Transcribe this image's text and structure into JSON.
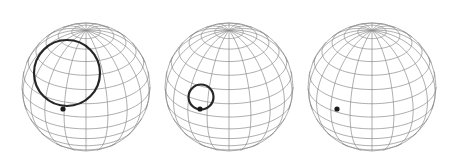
{
  "diagram": {
    "type": "spheres-with-contracting-loop",
    "colors": {
      "grid": "#8a8a8a",
      "outline": "#9a9a9a",
      "loop": "#262626",
      "point": "#1a1a1a",
      "background": "#ffffff"
    },
    "grid": {
      "latitudes": 14,
      "longitudes": 18,
      "tilt_deg": 28
    },
    "spheres": [
      {
        "id": "sphere-1",
        "cx": 86,
        "cy": 87,
        "r": 64,
        "loop": {
          "cx": 67,
          "cy": 73,
          "r": 33
        },
        "point": {
          "x": 63,
          "y": 109,
          "r": 2.6
        }
      },
      {
        "id": "sphere-2",
        "cx": 229,
        "cy": 87,
        "r": 64,
        "loop": {
          "cx": 201,
          "cy": 97,
          "r": 12.5
        },
        "point": {
          "x": 200,
          "y": 109,
          "r": 2.6
        }
      },
      {
        "id": "sphere-3",
        "cx": 372,
        "cy": 87,
        "r": 64,
        "loop": null,
        "point": {
          "x": 337,
          "y": 109,
          "r": 2.6
        }
      }
    ]
  }
}
